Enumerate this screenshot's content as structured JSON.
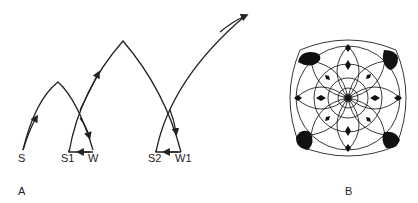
{
  "figure": {
    "panel_a": {
      "label": "A",
      "nodes": [
        {
          "id": "S",
          "label": "S"
        },
        {
          "id": "S1",
          "label": "S1"
        },
        {
          "id": "W",
          "label": "W"
        },
        {
          "id": "S2",
          "label": "S2"
        },
        {
          "id": "W1",
          "label": "W1"
        }
      ],
      "description": "Arcing trajectories with arrowheads: S rises and falls to W, loops back to S1; S1 rises higher and falls to W1, loops back to S2; S2 rises off to upper right."
    },
    "panel_b": {
      "label": "B",
      "description": "Concentric circular rosette pattern with overlapping arcs and black leaf/diamond shapes, with large black leaves at the four corners."
    },
    "colors": {
      "stroke": "#222222",
      "background": "#ffffff"
    }
  }
}
